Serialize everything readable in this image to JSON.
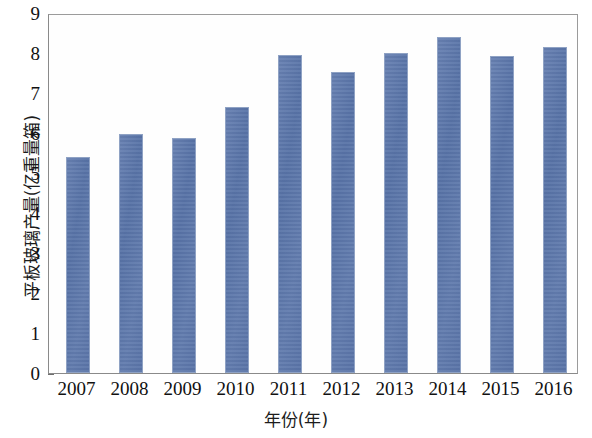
{
  "chart_data": {
    "type": "bar",
    "title": "",
    "xlabel": "年份(年)",
    "ylabel": "平板玻璃产量(亿重量箱)",
    "categories": [
      "2007",
      "2008",
      "2009",
      "2010",
      "2011",
      "2012",
      "2013",
      "2014",
      "2015",
      "2016"
    ],
    "values": [
      5.4,
      5.97,
      5.88,
      6.65,
      7.95,
      7.53,
      8.0,
      8.4,
      7.93,
      8.15
    ],
    "ylim": [
      0,
      9
    ],
    "yticks": [
      "0",
      "1",
      "2",
      "3",
      "4",
      "5",
      "6",
      "7",
      "8",
      "9"
    ],
    "ytick_values": [
      0,
      1,
      2,
      3,
      4,
      5,
      6,
      7,
      8,
      9
    ],
    "grid": false,
    "legend": null,
    "bar_color": "#5b74a8",
    "bar_edge_color": "#8fa2c4",
    "axis_color": "#8a8a8a",
    "series_name": "平板玻璃产量"
  }
}
